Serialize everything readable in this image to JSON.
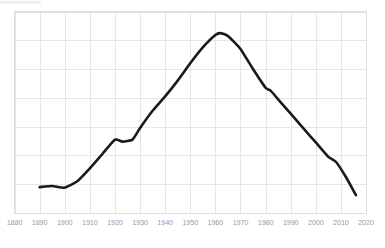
{
  "chart_data": {
    "type": "line",
    "title": "",
    "subtitle": "",
    "xlabel": "",
    "ylabel": "",
    "xlim": [
      1880,
      2020
    ],
    "ylim": [
      0,
      7
    ],
    "grid": true,
    "legend": null,
    "xticks": [
      1880,
      1890,
      1900,
      1910,
      1920,
      1930,
      1940,
      1950,
      1960,
      1970,
      1980,
      1990,
      2000,
      2010,
      2020
    ],
    "xtick_labels": [
      "1880",
      "1890",
      "1900",
      "1910",
      "1920",
      "1930",
      "1940",
      "1950",
      "1960",
      "1970",
      "1980",
      "1990",
      "2000",
      "2010",
      "2020"
    ],
    "yticks": [
      0,
      1,
      2,
      3,
      4,
      5,
      6,
      7
    ],
    "ytick_labels": [
      "",
      "",
      "",
      "",
      "",
      "",
      "",
      ""
    ],
    "line_color": "#1a1a1a",
    "line_width": 2.6,
    "grid_color": "#e6e6ea",
    "series": [
      {
        "name": "series-1",
        "x": [
          1890,
          1895,
          1900,
          1905,
          1910,
          1915,
          1920,
          1923,
          1927,
          1930,
          1935,
          1940,
          1945,
          1950,
          1955,
          1960,
          1962,
          1965,
          1970,
          1975,
          1980,
          1982,
          1985,
          1990,
          1995,
          2000,
          2005,
          2008,
          2012,
          2016
        ],
        "y": [
          0.9,
          0.94,
          0.88,
          1.1,
          1.55,
          2.05,
          2.55,
          2.48,
          2.55,
          2.95,
          3.55,
          4.05,
          4.6,
          5.2,
          5.75,
          6.18,
          6.25,
          6.15,
          5.7,
          5.0,
          4.35,
          4.25,
          3.95,
          3.45,
          2.95,
          2.45,
          1.95,
          1.78,
          1.25,
          0.62
        ]
      }
    ]
  },
  "axis": {
    "x_tick_font_size": "7.2px",
    "x_tick_color": "#9a9a9f"
  }
}
